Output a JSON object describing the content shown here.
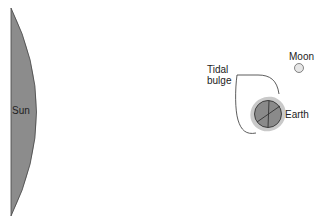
{
  "diagram": {
    "labels": {
      "sun": "Sun",
      "moon": "Moon",
      "earth": "Earth",
      "tidal_bulge_line1": "Tidal",
      "tidal_bulge_line2": "bulge"
    },
    "colors": {
      "sun_fill": "#8c8c8c",
      "earth_fill": "#8a8a8a",
      "bulge_halo": "#c9c9c9",
      "moon_fill": "#e6e6e6",
      "outline": "#333333"
    }
  }
}
